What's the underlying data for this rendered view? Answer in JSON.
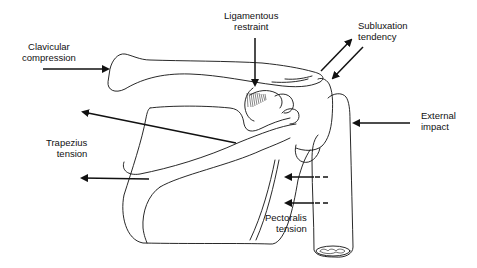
{
  "diagram": {
    "colors": {
      "line": "#111111",
      "background": "#ffffff"
    },
    "labels": {
      "clavicular_compression": {
        "line1": "Clavicular",
        "line2": "compression"
      },
      "ligamentous_restraint": {
        "line1": "Ligamentous",
        "line2": "restraint"
      },
      "subluxation_tendency": {
        "line1": "Subluxation",
        "line2": "tendency"
      },
      "external_impact": {
        "line1": "External",
        "line2": "impact"
      },
      "trapezius_tension": {
        "line1": "Trapezius",
        "line2": "tension"
      },
      "pectoralis_tension": {
        "line1": "Pectoralis",
        "line2": "tension"
      }
    },
    "arrows": [
      {
        "name": "clavicular-compression-arrow",
        "direction": "right"
      },
      {
        "name": "ligamentous-restraint-arrow",
        "direction": "down"
      },
      {
        "name": "subluxation-up-arrow",
        "direction": "up-right"
      },
      {
        "name": "subluxation-down-arrow",
        "direction": "down-left"
      },
      {
        "name": "external-impact-arrow",
        "direction": "left"
      },
      {
        "name": "trapezius-upper-arrow",
        "direction": "up-left"
      },
      {
        "name": "trapezius-lower-arrow",
        "direction": "left"
      },
      {
        "name": "pectoralis-upper-arrow",
        "direction": "left",
        "dashed_tail": true
      },
      {
        "name": "pectoralis-lower-arrow",
        "direction": "left",
        "dashed_tail": true
      }
    ]
  }
}
